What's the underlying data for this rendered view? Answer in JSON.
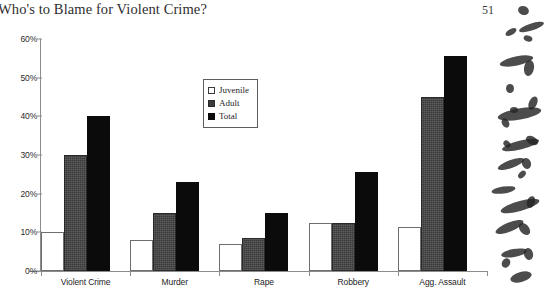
{
  "page": {
    "title": "Who's to Blame for Violent Crime?",
    "page_number": "51"
  },
  "legend": {
    "items": [
      {
        "label": "Juvenile",
        "swatch": "white-square-icon",
        "color": "#ffffff"
      },
      {
        "label": "Adult",
        "swatch": "gray-square-icon",
        "color": "#3a3a3a"
      },
      {
        "label": "Total",
        "swatch": "black-square-icon",
        "color": "#0b0b0b"
      }
    ]
  },
  "chart_data": {
    "type": "bar",
    "title": "Who's to Blame for Violent Crime?",
    "xlabel": "",
    "ylabel": "",
    "ylim": [
      0,
      60
    ],
    "ytick_labels": [
      "0%",
      "10%",
      "20%",
      "30%",
      "40%",
      "50%",
      "60%"
    ],
    "ytick_values": [
      0,
      10,
      20,
      30,
      40,
      50,
      60
    ],
    "grid": false,
    "legend_position": "upper-center",
    "categories": [
      "Violent Crime",
      "Murder",
      "Rape",
      "Robbery",
      "Agg. Assault"
    ],
    "series": [
      {
        "name": "Juvenile",
        "color": "#ffffff",
        "values": [
          10,
          8,
          7,
          12.5,
          11.5
        ]
      },
      {
        "name": "Adult",
        "color": "#3a3a3a",
        "values": [
          30,
          15,
          8.5,
          12.5,
          45
        ]
      },
      {
        "name": "Total",
        "color": "#0b0b0b",
        "values": [
          40,
          23,
          15,
          25.5,
          55.5
        ]
      }
    ]
  }
}
